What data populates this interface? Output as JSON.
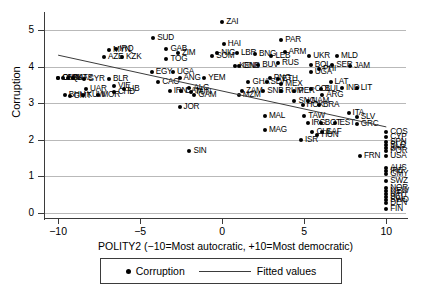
{
  "chart_data": {
    "type": "scatter",
    "title": "",
    "xlabel": "POLITY2 (−10=Most autocratic, +10=Most democratic)",
    "ylabel": "Corruption",
    "xlim": [
      -10.8,
      11.2
    ],
    "ylim": [
      -0.15,
      5.45
    ],
    "xticks": [
      -10,
      -5,
      0,
      5,
      10
    ],
    "xticklabels": [
      "−10",
      "−5",
      "0",
      "5",
      "10"
    ],
    "yticks": [
      0,
      1,
      2,
      3,
      4,
      5
    ],
    "yticklabels": [
      "0",
      "1",
      "2",
      "3",
      "4",
      "5"
    ],
    "grid": "horizontal",
    "legend": {
      "position": "bottom-center",
      "entries": [
        {
          "label": "Corruption",
          "marker": "filled-circle"
        },
        {
          "label": "Fitted values",
          "marker": "line"
        }
      ]
    },
    "fit_line": {
      "name": "Fitted values",
      "x": [
        -10,
        10
      ],
      "y": [
        4.32,
        2.35
      ]
    },
    "series": [
      {
        "name": "Corruption",
        "marker": "filled-circle",
        "points": [
          {
            "label": "CHK",
            "x": -10,
            "y": 3.7
          },
          {
            "label": "SAK",
            "x": -9.7,
            "y": 3.7
          },
          {
            "label": "OMN",
            "x": -10,
            "y": 3.7
          },
          {
            "label": "QAT",
            "x": -9.4,
            "y": 3.7
          },
          {
            "label": "UAE",
            "x": -9.1,
            "y": 3.7
          },
          {
            "label": "BHU",
            "x": -9.6,
            "y": 3.22
          },
          {
            "label": "GMT",
            "x": -9.3,
            "y": 3.2
          },
          {
            "label": "KUW",
            "x": -8.5,
            "y": 3.22
          },
          {
            "label": "SYR",
            "x": -8.4,
            "y": 3.66
          },
          {
            "label": "UAR",
            "x": -8.3,
            "y": 3.38
          },
          {
            "label": "MOR",
            "x": -7.6,
            "y": 3.22
          },
          {
            "label": "AZE",
            "x": -7.2,
            "y": 4.28
          },
          {
            "label": "MYN",
            "x": -6.9,
            "y": 4.46
          },
          {
            "label": "IRQ",
            "x": -6.5,
            "y": 4.5
          },
          {
            "label": "KZK",
            "x": -6.1,
            "y": 4.28
          },
          {
            "label": "BLR",
            "x": -6.9,
            "y": 3.66
          },
          {
            "label": "VIE",
            "x": -6.6,
            "y": 3.47
          },
          {
            "label": "CHD",
            "x": -6.6,
            "y": 3.3
          },
          {
            "label": "LIB",
            "x": -6.0,
            "y": 3.38
          },
          {
            "label": "SUD",
            "x": -4.2,
            "y": 4.78
          },
          {
            "label": "GAB",
            "x": -3.4,
            "y": 4.5
          },
          {
            "label": "ZIM",
            "x": -2.7,
            "y": 4.38
          },
          {
            "label": "TOG",
            "x": -3.4,
            "y": 4.22
          },
          {
            "label": "EGY",
            "x": -4.3,
            "y": 3.86
          },
          {
            "label": "UGA",
            "x": -3.0,
            "y": 3.86
          },
          {
            "label": "CAO",
            "x": -3.9,
            "y": 3.58
          },
          {
            "label": "ANG",
            "x": -2.6,
            "y": 3.7
          },
          {
            "label": "ALG",
            "x": -2.0,
            "y": 3.42
          },
          {
            "label": "IRN",
            "x": -3.2,
            "y": 3.34
          },
          {
            "label": "CAM",
            "x": -2.5,
            "y": 3.34
          },
          {
            "label": "TUN",
            "x": -1.9,
            "y": 3.3
          },
          {
            "label": "GAM",
            "x": -1.7,
            "y": 3.22
          },
          {
            "label": "JOR",
            "x": -2.6,
            "y": 2.9
          },
          {
            "label": "SIN",
            "x": -2.0,
            "y": 1.7
          },
          {
            "label": "ZAI",
            "x": 0.0,
            "y": 5.22
          },
          {
            "label": "HAI",
            "x": 0.1,
            "y": 4.64
          },
          {
            "label": "SOM",
            "x": -0.6,
            "y": 4.3
          },
          {
            "label": "NIG",
            "x": -0.3,
            "y": 4.38
          },
          {
            "label": "LBR",
            "x": 0.9,
            "y": 4.38
          },
          {
            "label": "BNG",
            "x": 2.0,
            "y": 4.34
          },
          {
            "label": "YEM",
            "x": -1.1,
            "y": 3.7
          },
          {
            "label": "GNB",
            "x": 1.0,
            "y": 4.02
          },
          {
            "label": "KEN",
            "x": 0.8,
            "y": 4.02
          },
          {
            "label": "BUV",
            "x": 2.2,
            "y": 4.06
          },
          {
            "label": "GHA",
            "x": 1.6,
            "y": 3.58
          },
          {
            "label": "ZAM",
            "x": 1.2,
            "y": 3.34
          },
          {
            "label": "MZM",
            "x": 1.0,
            "y": 3.22
          },
          {
            "label": "SLV2",
            "x": 2.7,
            "y": 3.58
          },
          {
            "label": "PNG",
            "x": 2.9,
            "y": 3.7
          },
          {
            "label": "ETH",
            "x": 3.4,
            "y": 3.66
          },
          {
            "label": "MEX",
            "x": 3.6,
            "y": 3.54
          },
          {
            "label": "SNB",
            "x": 2.5,
            "y": 3.34
          },
          {
            "label": "RUM",
            "x": 3.6,
            "y": 3.34
          },
          {
            "label": "LEB",
            "x": 3.0,
            "y": 4.3
          },
          {
            "label": "ARM",
            "x": 3.8,
            "y": 4.42
          },
          {
            "label": "RUS",
            "x": 3.4,
            "y": 4.1
          },
          {
            "label": "PAR",
            "x": 3.6,
            "y": 4.74
          },
          {
            "label": "UKR",
            "x": 5.3,
            "y": 4.3
          },
          {
            "label": "BOL",
            "x": 5.4,
            "y": 4.06
          },
          {
            "label": "PHI",
            "x": 5.9,
            "y": 3.94
          },
          {
            "label": "UGA2",
            "x": 5.4,
            "y": 3.86
          },
          {
            "label": "SER",
            "x": 6.7,
            "y": 4.06
          },
          {
            "label": "MLD",
            "x": 7.0,
            "y": 4.3
          },
          {
            "label": "JAM",
            "x": 7.8,
            "y": 4.02
          },
          {
            "label": "LAT",
            "x": 6.6,
            "y": 3.58
          },
          {
            "label": "IND",
            "x": 7.3,
            "y": 3.42
          },
          {
            "label": "LIT",
            "x": 8.2,
            "y": 3.42
          },
          {
            "label": "PER",
            "x": 4.4,
            "y": 3.34
          },
          {
            "label": "COL",
            "x": 5.4,
            "y": 3.38
          },
          {
            "label": "BUL",
            "x": 6.0,
            "y": 3.38
          },
          {
            "label": "ARG",
            "x": 6.1,
            "y": 3.22
          },
          {
            "label": "SNG",
            "x": 4.4,
            "y": 3.06
          },
          {
            "label": "NAM",
            "x": 5.2,
            "y": 3.06
          },
          {
            "label": "HOK",
            "x": 4.9,
            "y": 2.94
          },
          {
            "label": "BRA",
            "x": 5.9,
            "y": 2.94
          },
          {
            "label": "MAL",
            "x": 2.6,
            "y": 2.66
          },
          {
            "label": "TAW",
            "x": 5.0,
            "y": 2.66
          },
          {
            "label": "IRG",
            "x": 5.2,
            "y": 2.46
          },
          {
            "label": "BOT",
            "x": 6.0,
            "y": 2.46
          },
          {
            "label": "EST",
            "x": 6.9,
            "y": 2.46
          },
          {
            "label": "GRC",
            "x": 8.2,
            "y": 2.42
          },
          {
            "label": "ITA",
            "x": 7.7,
            "y": 2.74
          },
          {
            "label": "SLV3",
            "x": 8.2,
            "y": 2.62
          },
          {
            "label": "CHL",
            "x": 5.5,
            "y": 2.22
          },
          {
            "label": "SAF",
            "x": 6.1,
            "y": 2.22
          },
          {
            "label": "HUN",
            "x": 5.8,
            "y": 2.14
          },
          {
            "label": "MAG",
            "x": 2.6,
            "y": 2.26
          },
          {
            "label": "ISR",
            "x": 4.8,
            "y": 1.98
          },
          {
            "label": "COS",
            "x": 10,
            "y": 2.22
          },
          {
            "label": "CYP",
            "x": 10,
            "y": 2.06
          },
          {
            "label": "SPN",
            "x": 10,
            "y": 1.94
          },
          {
            "label": "BLG",
            "x": 10,
            "y": 1.86
          },
          {
            "label": "JAP",
            "x": 10,
            "y": 1.78
          },
          {
            "label": "POR",
            "x": 10,
            "y": 1.7
          },
          {
            "label": "USA",
            "x": 10,
            "y": 1.54
          },
          {
            "label": "FRN",
            "x": 8.4,
            "y": 1.54
          },
          {
            "label": "AUS",
            "x": 10,
            "y": 1.22
          },
          {
            "label": "IRE",
            "x": 10,
            "y": 1.14
          },
          {
            "label": "GMY",
            "x": 10,
            "y": 1.06
          },
          {
            "label": "SWZ",
            "x": 10,
            "y": 0.86
          },
          {
            "label": "NOR",
            "x": 10,
            "y": 0.66
          },
          {
            "label": "NEW",
            "x": 10,
            "y": 0.58
          },
          {
            "label": "NTH",
            "x": 10,
            "y": 0.5
          },
          {
            "label": "BEL",
            "x": 10,
            "y": 0.42
          },
          {
            "label": "SWD",
            "x": 10,
            "y": 0.34
          },
          {
            "label": "DEN",
            "x": 10,
            "y": 0.26
          },
          {
            "label": "FIN",
            "x": 10,
            "y": 0.1
          }
        ]
      }
    ]
  }
}
